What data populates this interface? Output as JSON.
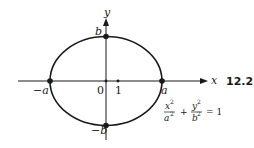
{
  "figure": {
    "number": "12.2",
    "axes": {
      "x_label": "x",
      "y_label": "y"
    },
    "points": {
      "pos_a": "a",
      "neg_a": "−a",
      "pos_b": "b",
      "neg_b": "−b",
      "origin": "0",
      "one": "1"
    },
    "equation": {
      "num1": "x",
      "den1": "a",
      "num2": "y",
      "den2": "b",
      "exp": "2",
      "plus": "+",
      "equals": "= 1"
    }
  }
}
